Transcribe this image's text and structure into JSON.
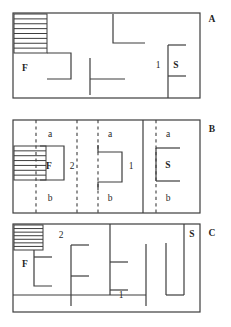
{
  "figure": {
    "title": "",
    "background_color": "#ffffff",
    "line_color": "#3d3d3d",
    "panel_count": 3
  },
  "panels": [
    {
      "id": "panel-a",
      "letter": "A",
      "letter_pos": {
        "x": 212,
        "y": 20
      },
      "frame": {
        "x": 13,
        "y": 13,
        "width": 187,
        "height": 85
      },
      "hatch": {
        "x": 14,
        "y": 14,
        "width": 33,
        "height": 39,
        "stripes": 8
      },
      "labels": [
        {
          "name": "label-f",
          "text": "F",
          "x": 25,
          "y": 69,
          "bold": true
        },
        {
          "name": "label-1",
          "text": "1",
          "x": 158,
          "y": 66,
          "bold": false
        },
        {
          "name": "label-s",
          "text": "S",
          "x": 176,
          "y": 66,
          "bold": true
        }
      ],
      "walls": [
        {
          "name": "wall-box-f",
          "points": "47,53 71,53 71,79 47,79"
        },
        {
          "name": "wall-tee-center",
          "points": "90,58 90,95"
        },
        {
          "name": "wall-tee-arm",
          "points": "90,79 125,79"
        },
        {
          "name": "wall-upper-hook",
          "points": "113,14 113,43 145,43"
        },
        {
          "name": "wall-s-vert",
          "points": "168,45 168,98"
        },
        {
          "name": "wall-s-top",
          "points": "168,45 186,45"
        },
        {
          "name": "wall-s-bot",
          "points": "168,76 186,76"
        }
      ]
    },
    {
      "id": "panel-b",
      "letter": "B",
      "letter_pos": {
        "x": 212,
        "y": 130
      },
      "frame": {
        "x": 13,
        "y": 120,
        "width": 187,
        "height": 93
      },
      "hatch": {
        "x": 14,
        "y": 146,
        "width": 32,
        "height": 34,
        "stripes": 7
      },
      "labels": [
        {
          "name": "label-a-1",
          "text": "a",
          "x": 50,
          "y": 135,
          "bold": false
        },
        {
          "name": "label-a-2",
          "text": "a",
          "x": 110,
          "y": 135,
          "bold": false
        },
        {
          "name": "label-a-3",
          "text": "a",
          "x": 168,
          "y": 135,
          "bold": false
        },
        {
          "name": "label-f",
          "text": "F",
          "x": 49,
          "y": 167,
          "bold": true
        },
        {
          "name": "label-2",
          "text": "2",
          "x": 72,
          "y": 167,
          "bold": false
        },
        {
          "name": "label-1",
          "text": "1",
          "x": 131,
          "y": 167,
          "bold": false
        },
        {
          "name": "label-s",
          "text": "S",
          "x": 168,
          "y": 166,
          "bold": true
        },
        {
          "name": "label-b-1",
          "text": "b",
          "x": 50,
          "y": 199,
          "bold": false
        },
        {
          "name": "label-b-2",
          "text": "b",
          "x": 110,
          "y": 199,
          "bold": false
        },
        {
          "name": "label-b-3",
          "text": "b",
          "x": 168,
          "y": 199,
          "bold": false
        }
      ],
      "dashed": [
        {
          "name": "dash-1",
          "x": 36,
          "y1": 120,
          "y2": 213
        },
        {
          "name": "dash-2",
          "x": 77,
          "y1": 120,
          "y2": 213
        },
        {
          "name": "dash-3",
          "x": 98,
          "y1": 120,
          "y2": 213
        },
        {
          "name": "dash-4",
          "x": 156,
          "y1": 120,
          "y2": 213
        }
      ],
      "walls": [
        {
          "name": "wall-f-box",
          "points": "40,146 64,146 64,180 40,180"
        },
        {
          "name": "wall-1-box",
          "points": "98,145 98,152 122,152 122,182 98,182 98,190"
        },
        {
          "name": "wall-solid-mid",
          "points": "143,120 143,213"
        },
        {
          "name": "wall-s-top",
          "points": "156,148 180,148"
        },
        {
          "name": "wall-s-vert",
          "points": "156,148 156,181"
        },
        {
          "name": "wall-s-bot",
          "points": "156,181 180,181"
        }
      ]
    },
    {
      "id": "panel-c",
      "letter": "C",
      "letter_pos": {
        "x": 212,
        "y": 234
      },
      "frame": {
        "x": 13,
        "y": 224,
        "width": 187,
        "height": 88
      },
      "hatch": {
        "x": 14,
        "y": 225,
        "width": 29,
        "height": 25,
        "stripes": 7
      },
      "labels": [
        {
          "name": "label-f",
          "text": "F",
          "x": 25,
          "y": 265,
          "bold": true
        },
        {
          "name": "label-2",
          "text": "2",
          "x": 61,
          "y": 236,
          "bold": false
        },
        {
          "name": "label-1",
          "text": "1",
          "x": 121,
          "y": 296,
          "bold": false
        },
        {
          "name": "label-s",
          "text": "S",
          "x": 192,
          "y": 235,
          "bold": true
        }
      ],
      "walls": [
        {
          "name": "wall-c-hook-f",
          "points": "34,250 34,286 52,286"
        },
        {
          "name": "wall-c-arm-f",
          "points": "34,257 52,257"
        },
        {
          "name": "wall-c-vert-2",
          "points": "71,245 71,306"
        },
        {
          "name": "wall-c-arm-2top",
          "points": "71,245 89,245"
        },
        {
          "name": "wall-c-arm-2mid",
          "points": "71,276 89,276"
        },
        {
          "name": "wall-c-vert-1",
          "points": "110,224 110,295"
        },
        {
          "name": "wall-c-arm-1top",
          "points": "110,262 128,262"
        },
        {
          "name": "wall-c-arm-1bot",
          "points": "110,290 128,290"
        },
        {
          "name": "wall-c-vert-right1",
          "points": "146,244 146,306"
        },
        {
          "name": "wall-c-vert-right2",
          "points": "166,243 166,295"
        },
        {
          "name": "wall-c-vert-right3",
          "points": "184,243 184,295"
        },
        {
          "name": "wall-c-bot-right",
          "points": "166,295 184,295"
        },
        {
          "name": "wall-c-corridor",
          "points": "13,295 146,295"
        },
        {
          "name": "wall-c-s-vert",
          "points": "184,224 184,243"
        }
      ]
    }
  ]
}
